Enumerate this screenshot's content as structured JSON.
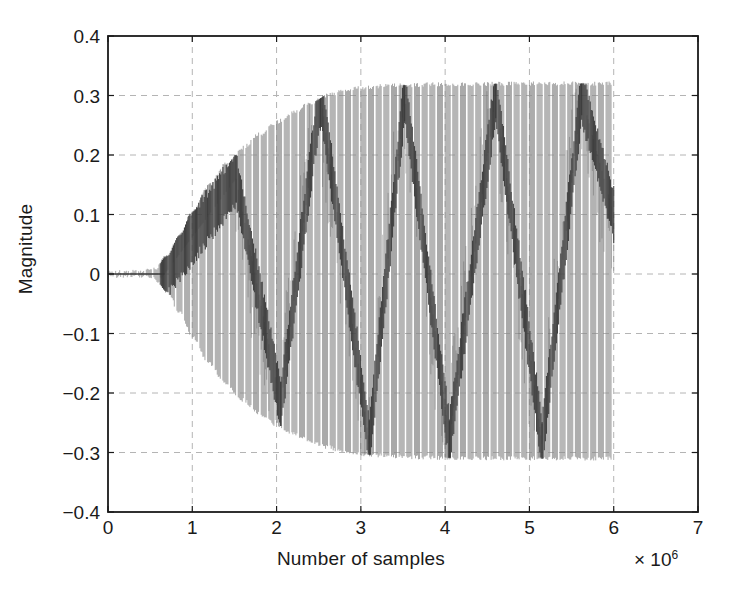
{
  "chart_data": {
    "type": "line",
    "title": "",
    "xlabel": "Number of samples",
    "ylabel": "Magnitude",
    "x_exponent_prefix": "× 10",
    "x_exponent_power": "6",
    "xlim": [
      0,
      7
    ],
    "ylim": [
      -0.4,
      0.4
    ],
    "xticks": [
      0,
      1,
      2,
      3,
      4,
      5,
      6,
      7
    ],
    "xticklabels": [
      "0",
      "1",
      "2",
      "3",
      "4",
      "5",
      "6",
      "7"
    ],
    "yticks": [
      0.4,
      0.3,
      0.2,
      0.1,
      0,
      -0.1,
      -0.2,
      -0.3,
      -0.4
    ],
    "yticklabels": [
      "0.4",
      "0.3",
      "0.2",
      "0.1",
      "0",
      "−0.1",
      "−0.2",
      "−0.3",
      "−0.4"
    ],
    "grid": true,
    "grid_style": "dashed",
    "grid_color": "#b4b4b4",
    "axis_color": "#1a1a1a",
    "trace_color": "#8c8c8c",
    "trace_dark_color": "#3a3a3a",
    "legend": null,
    "series": [
      {
        "name": "adaptive filter weight trajectory",
        "description": "Dense high-frequency oscillation whose envelope grows from 0 and saturates; inner darker sawtooth modulation bands sweep between the envelope bounds.",
        "x_data_start": 0.0,
        "x_data_end": 6.0,
        "x_growth_onset": 0.55,
        "x_envelope_saturation": 2.9,
        "envelope_upper_final": 0.32,
        "envelope_lower_final": -0.31,
        "envelope_points": [
          {
            "x": 0.0,
            "upper": 0.003,
            "lower": -0.003
          },
          {
            "x": 0.4,
            "upper": 0.004,
            "lower": -0.004
          },
          {
            "x": 0.55,
            "upper": 0.008,
            "lower": -0.008
          },
          {
            "x": 0.7,
            "upper": 0.03,
            "lower": -0.03
          },
          {
            "x": 0.85,
            "upper": 0.065,
            "lower": -0.065
          },
          {
            "x": 1.0,
            "upper": 0.105,
            "lower": -0.105
          },
          {
            "x": 1.2,
            "upper": 0.15,
            "lower": -0.15
          },
          {
            "x": 1.4,
            "upper": 0.185,
            "lower": -0.185
          },
          {
            "x": 1.6,
            "upper": 0.212,
            "lower": -0.212
          },
          {
            "x": 1.8,
            "upper": 0.235,
            "lower": -0.235
          },
          {
            "x": 2.0,
            "upper": 0.255,
            "lower": -0.253
          },
          {
            "x": 2.2,
            "upper": 0.272,
            "lower": -0.268
          },
          {
            "x": 2.4,
            "upper": 0.287,
            "lower": -0.281
          },
          {
            "x": 2.6,
            "upper": 0.3,
            "lower": -0.291
          },
          {
            "x": 2.8,
            "upper": 0.308,
            "lower": -0.299
          },
          {
            "x": 3.0,
            "upper": 0.313,
            "lower": -0.303
          },
          {
            "x": 3.4,
            "upper": 0.317,
            "lower": -0.307
          },
          {
            "x": 4.0,
            "upper": 0.319,
            "lower": -0.309
          },
          {
            "x": 5.0,
            "upper": 0.32,
            "lower": -0.31
          },
          {
            "x": 6.0,
            "upper": 0.32,
            "lower": -0.31
          }
        ],
        "sawtooth_ramps": [
          {
            "x_start": 0.62,
            "x_end": 1.52,
            "y_start": -0.01,
            "y_end": 0.16
          },
          {
            "x_start": 1.52,
            "x_end": 2.05,
            "y_start": 0.16,
            "y_end": -0.22
          },
          {
            "x_start": 2.05,
            "x_end": 2.52,
            "y_start": -0.22,
            "y_end": 0.305
          },
          {
            "x_start": 2.52,
            "x_end": 3.1,
            "y_start": 0.305,
            "y_end": -0.285
          },
          {
            "x_start": 3.1,
            "x_end": 3.52,
            "y_start": -0.285,
            "y_end": 0.3
          },
          {
            "x_start": 3.52,
            "x_end": 4.05,
            "y_start": 0.3,
            "y_end": -0.28
          },
          {
            "x_start": 4.05,
            "x_end": 4.6,
            "y_start": -0.28,
            "y_end": 0.3
          },
          {
            "x_start": 4.6,
            "x_end": 5.15,
            "y_start": 0.3,
            "y_end": -0.285
          },
          {
            "x_start": 5.15,
            "x_end": 5.62,
            "y_start": -0.285,
            "y_end": 0.3
          },
          {
            "x_start": 5.62,
            "x_end": 6.0,
            "y_start": 0.3,
            "y_end": 0.1
          }
        ]
      }
    ]
  },
  "plot": {
    "axis_box": {
      "left": 108,
      "top": 36,
      "right": 698,
      "bottom": 512
    }
  }
}
